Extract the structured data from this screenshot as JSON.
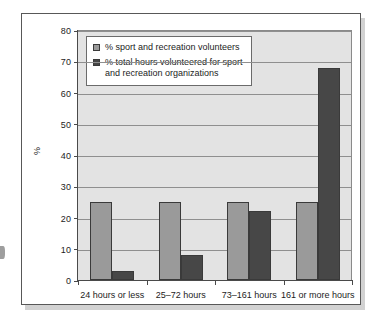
{
  "figure": {
    "axis_y_title": "%",
    "fragment_label": ")"
  },
  "legend": {
    "position": "top-left-inside",
    "entries": [
      {
        "label": "% sport and recreation volunteers",
        "color": "#9a9a9a"
      },
      {
        "label": "% total hours volunteered for sport\nand recreation organizations",
        "color": "#474747"
      }
    ]
  },
  "chart_data": {
    "type": "bar",
    "title": "",
    "xlabel": "",
    "ylabel": "%",
    "ylim": [
      0,
      80
    ],
    "yticks": [
      0,
      10,
      20,
      30,
      40,
      50,
      60,
      70,
      80
    ],
    "grid": true,
    "legend_position": "top-left-inside",
    "categories": [
      "24 hours or less",
      "25–72 hours",
      "73–161 hours",
      "161 or more hours"
    ],
    "series": [
      {
        "name": "% sport and recreation volunteers",
        "color": "#9a9a9a",
        "values": [
          25,
          25,
          25,
          25
        ]
      },
      {
        "name": "% total hours volunteered for sport and recreation organizations",
        "color": "#474747",
        "values": [
          3,
          8,
          22,
          68
        ]
      }
    ]
  }
}
